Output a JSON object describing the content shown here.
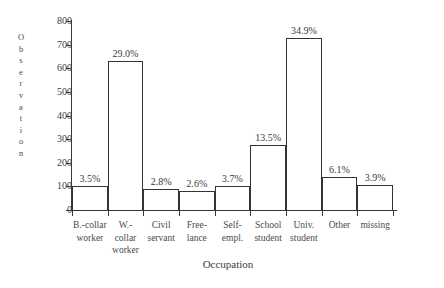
{
  "chart_data": {
    "type": "bar",
    "title": "",
    "xlabel": "Occupation",
    "ylabel": "Observation",
    "ylim": [
      0,
      800
    ],
    "yticks": [
      0,
      100,
      200,
      300,
      400,
      500,
      600,
      700,
      800
    ],
    "grid": false,
    "legend": null,
    "categories": [
      "B.-collar worker",
      "W.-collar worker",
      "Civil servant",
      "Free-lance",
      "Self-empl.",
      "School student",
      "Univ. student",
      "Other",
      "missing"
    ],
    "category_lines": [
      [
        "B.-collar",
        "worker"
      ],
      [
        "W.-",
        "collar",
        "worker"
      ],
      [
        "Civil",
        "servant"
      ],
      [
        "Free-",
        "lance"
      ],
      [
        "Self-",
        "empl."
      ],
      [
        "School",
        "student"
      ],
      [
        "Univ.",
        "student"
      ],
      [
        "Other"
      ],
      [
        "missing"
      ]
    ],
    "values": [
      100,
      630,
      88,
      80,
      103,
      277,
      727,
      140,
      107
    ],
    "data_labels": [
      "3.5%",
      "29.0%",
      "2.8%",
      "2.6%",
      "3.7%",
      "13.5%",
      "34.9%",
      "6.1%",
      "3.9%"
    ],
    "percentages": [
      3.5,
      29.0,
      2.8,
      2.6,
      3.7,
      13.5,
      34.9,
      6.1,
      3.9
    ],
    "bar_style": {
      "fill": "#ffffff",
      "edge": "#333333"
    }
  },
  "axis": {
    "y_title_letters": [
      "O",
      "b",
      "s",
      "e",
      "r",
      "v",
      "a",
      "t",
      "i",
      "o",
      "n"
    ],
    "y_tick_labels": [
      "800",
      "700",
      "600",
      "500",
      "400",
      "300",
      "200",
      "100",
      "0"
    ],
    "x_title": "Occupation"
  },
  "colors": {
    "ink": "#3a3a3a",
    "bar_edge": "#333333",
    "background": "#ffffff"
  }
}
